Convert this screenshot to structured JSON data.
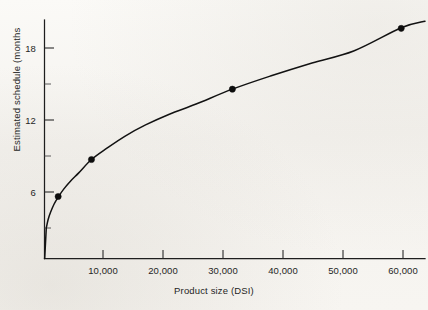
{
  "chart_data": {
    "type": "line",
    "title": "",
    "xlabel": "Product size (DSI)",
    "ylabel": "Estimated schedule (months",
    "xlim": [
      0,
      64000
    ],
    "ylim": [
      0,
      20
    ],
    "grid": false,
    "legend": "none",
    "x_ticks": [
      10000,
      20000,
      30000,
      40000,
      50000,
      60000
    ],
    "x_tick_labels": [
      "10,000",
      "20,000",
      "30,000",
      "40,000",
      "50,000",
      "60,000"
    ],
    "y_ticks": [
      6,
      12,
      18
    ],
    "y_tick_labels": [
      "6",
      "12",
      "18"
    ],
    "y_minor_ticks": [
      3,
      9,
      15
    ],
    "series": [
      {
        "name": "Estimated schedule curve",
        "type": "line",
        "x": [
          300,
          600,
          1000,
          1600,
          2300,
          3200,
          4400,
          5800,
          7900,
          10500,
          13500,
          17000,
          21000,
          25500,
          31600,
          38000,
          45000,
          52000,
          60000,
          64000
        ],
        "y": [
          2.55,
          3.25,
          3.85,
          4.55,
          5.15,
          5.8,
          6.5,
          7.2,
          8.3,
          9.25,
          10.25,
          11.2,
          12.1,
          12.95,
          14.2,
          15.3,
          16.4,
          17.4,
          19.35,
          19.9
        ]
      },
      {
        "name": "Observed projects",
        "type": "scatter",
        "x": [
          2300,
          7900,
          31600,
          60000
        ],
        "y": [
          5.2,
          8.3,
          14.2,
          19.3
        ]
      }
    ]
  },
  "figure": {
    "background_color": "#f6f4f0",
    "ink_color": "#121212",
    "marker_color": "#0d0d0d"
  }
}
